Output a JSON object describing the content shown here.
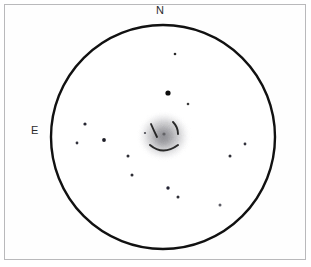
{
  "sketch": {
    "title": "Telescope eyepiece field-of-view sketch",
    "medium": "pencil on white paper",
    "orientation_labels": {
      "north": "N",
      "east": "E"
    },
    "field_circle": {
      "cx": 163,
      "cy": 137,
      "r": 112,
      "stroke": "#111111",
      "stroke_width": 2.4,
      "fill": "#ffffff"
    },
    "frame": {
      "stroke": "#b9b9bb",
      "fill": "#fefefe"
    },
    "deep_sky_object": {
      "name": "central-nebula",
      "type": "diffuse nebulosity with dark lanes",
      "cx": 164,
      "cy": 136,
      "rx": 27,
      "ry": 25,
      "halo_color": "#9a9a9e",
      "core_color": "#8b8b90",
      "dark_lane_color": "#1a1a1a",
      "dark_lanes": [
        {
          "name": "upper-left-arc",
          "d": "M 151 124 Q 154 131 157 137"
        },
        {
          "name": "upper-right-arc",
          "d": "M 173 122 Q 178 127 178 134"
        },
        {
          "name": "lower-arc",
          "d": "M 150 145 Q 163 156 178 145"
        }
      ],
      "core_point": {
        "cx": 164,
        "cy": 134,
        "r": 1.6
      }
    },
    "stars": [
      {
        "id": "star-1",
        "cx": 175,
        "cy": 54,
        "r": 1.3,
        "brightness": "faint"
      },
      {
        "id": "star-2",
        "cx": 168,
        "cy": 93,
        "r": 2.6,
        "brightness": "bright"
      },
      {
        "id": "star-3",
        "cx": 188,
        "cy": 104,
        "r": 1.3,
        "brightness": "faint"
      },
      {
        "id": "star-4",
        "cx": 85,
        "cy": 124,
        "r": 1.6,
        "brightness": "medium"
      },
      {
        "id": "star-5",
        "cx": 104,
        "cy": 140,
        "r": 1.9,
        "brightness": "medium"
      },
      {
        "id": "star-6",
        "cx": 77,
        "cy": 143,
        "r": 1.4,
        "brightness": "faint"
      },
      {
        "id": "star-7",
        "cx": 245,
        "cy": 144,
        "r": 1.4,
        "brightness": "faint"
      },
      {
        "id": "star-8",
        "cx": 230,
        "cy": 156,
        "r": 1.5,
        "brightness": "faint"
      },
      {
        "id": "star-9",
        "cx": 128,
        "cy": 156,
        "r": 1.5,
        "brightness": "faint"
      },
      {
        "id": "star-10",
        "cx": 132,
        "cy": 175,
        "r": 1.5,
        "brightness": "faint"
      },
      {
        "id": "star-11",
        "cx": 168,
        "cy": 188,
        "r": 1.7,
        "brightness": "medium"
      },
      {
        "id": "star-12",
        "cx": 178,
        "cy": 197,
        "r": 1.5,
        "brightness": "faint"
      },
      {
        "id": "star-13",
        "cx": 220,
        "cy": 205,
        "r": 1.5,
        "brightness": "faint"
      },
      {
        "id": "star-14",
        "cx": 145,
        "cy": 133,
        "r": 1.1,
        "brightness": "very-faint"
      }
    ]
  }
}
